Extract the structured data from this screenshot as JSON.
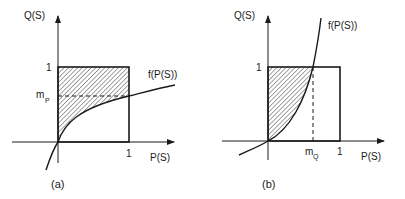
{
  "figure": {
    "panels": [
      {
        "id": "a",
        "caption": "(a)",
        "y_axis_label": "Q(S)",
        "x_axis_label": "P(S)",
        "y_tick_one": "1",
        "x_tick_one": "1",
        "marker_label_main": "m",
        "marker_label_sub": "P",
        "curve_label": "f(P(S))",
        "description": "Concave curve f(P(S)) crosses x=1 at Q=m_P; hatched area above curve inside unit square"
      },
      {
        "id": "b",
        "caption": "(b)",
        "y_axis_label": "Q(S)",
        "x_axis_label": "P(S)",
        "y_tick_one": "1",
        "x_tick_one": "1",
        "marker_label_main": "m",
        "marker_label_sub": "Q",
        "curve_label": "f(P(S))",
        "description": "Convex curve f(P(S)) reaches Q=1 at P=m_Q; hatched area above curve inside unit square"
      }
    ],
    "colors": {
      "ink": "#1a1a1a",
      "background": "#ffffff"
    }
  }
}
